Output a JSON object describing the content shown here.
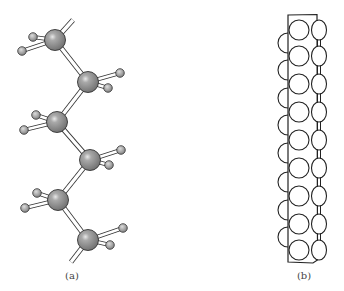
{
  "figure": {
    "panels": [
      {
        "id": "a",
        "label": "(a)",
        "description": "Ball-and-stick model of zigzag polyethylene chain",
        "carbon_color": "#8a8a8a",
        "hydrogen_color": "#9a9a9a",
        "carbons": [
          {
            "x": 55,
            "y": 40
          },
          {
            "x": 88,
            "y": 82
          },
          {
            "x": 57,
            "y": 122
          },
          {
            "x": 90,
            "y": 160
          },
          {
            "x": 58,
            "y": 200
          },
          {
            "x": 88,
            "y": 240
          }
        ],
        "hydrogens": [
          [
            {
              "x": 33,
              "y": 37
            },
            {
              "x": 22,
              "y": 51
            }
          ],
          [
            {
              "x": 120,
              "y": 73
            },
            {
              "x": 108,
              "y": 88
            }
          ],
          [
            {
              "x": 36,
              "y": 115
            },
            {
              "x": 24,
              "y": 130
            }
          ],
          [
            {
              "x": 121,
              "y": 150
            },
            {
              "x": 109,
              "y": 165
            }
          ],
          [
            {
              "x": 37,
              "y": 193
            },
            {
              "x": 25,
              "y": 208
            }
          ],
          [
            {
              "x": 123,
              "y": 228
            },
            {
              "x": 110,
              "y": 245
            }
          ]
        ],
        "chain_ends": {
          "top": {
            "x": 73,
            "y": 20
          },
          "bottom": {
            "x": 71,
            "y": 262
          }
        }
      },
      {
        "id": "b",
        "label": "(b)",
        "description": "Space-filling outline of polyethylene chain",
        "rect": {
          "x": 288,
          "y": 15,
          "w": 29,
          "h": 247
        },
        "left_column_x": 299,
        "right_column_x": 319,
        "row_ys": [
          30,
          56,
          84,
          112,
          140,
          168,
          196,
          224,
          250
        ],
        "half_circle_ys": [
          43,
          70,
          98,
          125,
          153,
          182,
          210,
          237
        ]
      }
    ]
  }
}
